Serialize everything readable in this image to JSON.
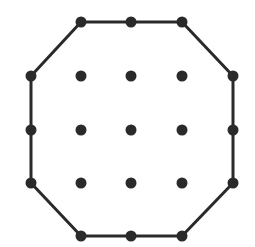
{
  "diagram": {
    "type": "geoboard-octagon",
    "grid": {
      "columns": [
        31,
        81,
        131,
        182,
        233
      ],
      "rows": [
        22,
        76,
        130,
        183,
        236
      ]
    },
    "colors": {
      "background": "#ffffff",
      "stroke": "#2a2a2a",
      "dot": "#2a2a2a"
    },
    "polygon": {
      "name": "octagon",
      "stroke_width": 3,
      "vertices": [
        [
          81,
          22
        ],
        [
          131,
          22
        ],
        [
          182,
          22
        ],
        [
          233,
          76
        ],
        [
          233,
          130
        ],
        [
          233,
          183
        ],
        [
          182,
          236
        ],
        [
          131,
          236
        ],
        [
          81,
          236
        ],
        [
          31,
          183
        ],
        [
          31,
          130
        ],
        [
          31,
          76
        ]
      ]
    },
    "boundary_points": [
      [
        81,
        22
      ],
      [
        131,
        22
      ],
      [
        182,
        22
      ],
      [
        233,
        76
      ],
      [
        233,
        130
      ],
      [
        233,
        183
      ],
      [
        182,
        236
      ],
      [
        131,
        236
      ],
      [
        81,
        236
      ],
      [
        31,
        183
      ],
      [
        31,
        130
      ],
      [
        31,
        76
      ]
    ],
    "interior_points": [
      [
        81,
        76
      ],
      [
        131,
        76
      ],
      [
        182,
        76
      ],
      [
        81,
        130
      ],
      [
        131,
        130
      ],
      [
        182,
        130
      ],
      [
        81,
        183
      ],
      [
        131,
        183
      ],
      [
        182,
        183
      ]
    ],
    "dot_radius": 5.5
  }
}
